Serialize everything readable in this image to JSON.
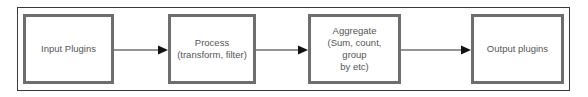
{
  "diagram": {
    "type": "flowchart",
    "direction": "left-to-right",
    "nodes": [
      {
        "id": "input",
        "label": "Input Plugins"
      },
      {
        "id": "process",
        "label": "Process\n(transform, filter)",
        "lines": [
          "Process",
          "(transform, filter)"
        ]
      },
      {
        "id": "aggregate",
        "label": "Aggregate\n(Sum, count, group by etc)",
        "lines": [
          "Aggregate",
          "(Sum, count, group",
          "by etc)"
        ]
      },
      {
        "id": "output",
        "label": "Output plugins"
      }
    ],
    "edges": [
      {
        "from": "input",
        "to": "process"
      },
      {
        "from": "process",
        "to": "aggregate"
      },
      {
        "from": "aggregate",
        "to": "output"
      }
    ],
    "colors": {
      "node_border": "#6e6e6e",
      "frame_border": "#3a3a3a",
      "text": "#555555",
      "arrow": "#1a1a1a",
      "background": "#ffffff"
    }
  }
}
